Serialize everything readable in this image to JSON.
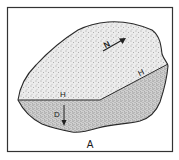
{
  "figure": {
    "panel_label": "A",
    "labels": {
      "north": "N",
      "horizontal_left": "H",
      "horizontal_right": "H",
      "dip": "D"
    },
    "colors": {
      "outline": "#2a2a2a",
      "frame": "#333333",
      "upper_face": "#dcdcdc",
      "lower_face": "#bdbdbd",
      "background": "#ffffff"
    }
  }
}
